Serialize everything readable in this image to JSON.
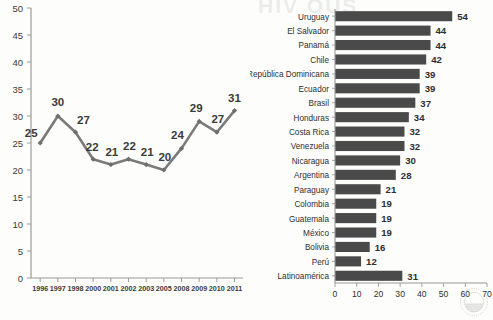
{
  "figure": {
    "background_color": "#fdfdfc",
    "series_color": "#7a7a7a",
    "bar_color": "#4a4a4a",
    "axis_color": "#9a9a9a",
    "label_color": "#3a3a3a"
  },
  "watermark": {
    "top_text": "HIV OUS",
    "mid_text": " ",
    "low_text": " ",
    "low_text2": " ",
    "logo_name": "circular-seal-logo"
  },
  "chart_data": [
    {
      "id": "line",
      "type": "line",
      "title": "",
      "xlabel": "",
      "ylabel": "",
      "categories": [
        "1996",
        "1997",
        "1998",
        "2000",
        "2001",
        "2002",
        "2003",
        "2005",
        "2008",
        "2009",
        "2010",
        "2011"
      ],
      "values": [
        25,
        30,
        27,
        22,
        21,
        22,
        21,
        20,
        24,
        29,
        27,
        31
      ],
      "data_labels": [
        "25",
        "30",
        "27",
        "22",
        "21",
        "22",
        "21",
        "20",
        "24",
        "29",
        "27",
        "31"
      ],
      "ylim": [
        0,
        50
      ],
      "ytick_step": 5,
      "yticks": [
        "0",
        "5",
        "10",
        "15",
        "20",
        "25",
        "30",
        "35",
        "40",
        "45",
        "50"
      ],
      "grid": false,
      "legend": "none",
      "marker": "diamond",
      "line_color": "#7a7a7a"
    },
    {
      "id": "bars",
      "type": "bar",
      "orientation": "horizontal",
      "title": "",
      "xlabel": "",
      "ylabel": "",
      "categories": [
        "Uruguay",
        "El Salvador",
        "Panamá",
        "Chile",
        "República Dominicana",
        "Ecuador",
        "Brasil",
        "Honduras",
        "Costa Rica",
        "Venezuela",
        "Nicaragua",
        "Argentina",
        "Paraguay",
        "Colombia",
        "Guatemala",
        "México",
        "Bolivia",
        "Perú",
        "Latinoamérica"
      ],
      "values": [
        54,
        44,
        44,
        42,
        39,
        39,
        37,
        34,
        32,
        32,
        30,
        28,
        21,
        19,
        19,
        19,
        16,
        12,
        31
      ],
      "data_labels": [
        "54",
        "44",
        "44",
        "42",
        "39",
        "39",
        "37",
        "34",
        "32",
        "32",
        "30",
        "28",
        "21",
        "19",
        "19",
        "19",
        "16",
        "12",
        "31"
      ],
      "xlim": [
        0,
        70
      ],
      "xtick_step": 10,
      "xticks": [
        "0",
        "10",
        "20",
        "30",
        "40",
        "50",
        "60",
        "70"
      ],
      "grid": false,
      "legend": "none",
      "bar_color": "#4a4a4a"
    }
  ]
}
